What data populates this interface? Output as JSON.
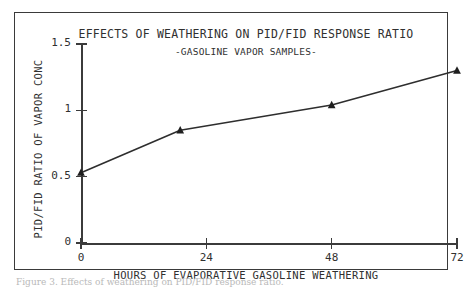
{
  "figure": {
    "caption": "Figure 3.  Effects of weathering on PID/FID response ratio."
  },
  "chart_data": {
    "type": "line",
    "title": "EFFECTS OF WEATHERING ON PID/FID RESPONSE RATIO",
    "subtitle": "-GASOLINE VAPOR SAMPLES-",
    "xlabel": "HOURS OF EVAPORATIVE GASOLINE WEATHERING",
    "ylabel": "PID/FID RATIO OF VAPOR CONC",
    "x": [
      0,
      19,
      48,
      72
    ],
    "values": [
      0.53,
      0.85,
      1.04,
      1.3
    ],
    "xlim": [
      0,
      72
    ],
    "ylim": [
      0,
      1.5
    ],
    "xticks": [
      0,
      24,
      48,
      72
    ],
    "xtick_labels": [
      "0",
      "24",
      "48",
      "72"
    ],
    "yticks": [
      0,
      0.5,
      1,
      1.5
    ],
    "ytick_labels": [
      "0",
      "0.5",
      "1",
      "1.5"
    ],
    "grid": false,
    "legend": false,
    "marker": "triangle",
    "line_color": "#2e2e2e",
    "marker_color": "#1f1f1f",
    "axis_color": "#3b3b3b",
    "background": "#ffffff"
  }
}
